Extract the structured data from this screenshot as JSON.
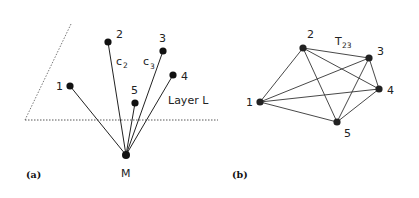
{
  "panel_a": {
    "caption": "(a)",
    "layer_label": "Layer L",
    "center_label": "M",
    "nodes": [
      {
        "id": "1",
        "label": "1"
      },
      {
        "id": "2",
        "label": "2"
      },
      {
        "id": "3",
        "label": "3"
      },
      {
        "id": "4",
        "label": "4"
      },
      {
        "id": "5",
        "label": "5"
      }
    ],
    "edge_labels": {
      "c2": {
        "main": "c",
        "sub": "2"
      },
      "c3": {
        "main": "c",
        "sub": "3"
      }
    }
  },
  "panel_b": {
    "caption": "(b)",
    "edge_label": {
      "main": "T",
      "sub": "23"
    },
    "nodes": [
      {
        "id": "1",
        "label": "1"
      },
      {
        "id": "2",
        "label": "2"
      },
      {
        "id": "3",
        "label": "3"
      },
      {
        "id": "4",
        "label": "4"
      },
      {
        "id": "5",
        "label": "5"
      }
    ],
    "edges": "complete graph K5"
  }
}
